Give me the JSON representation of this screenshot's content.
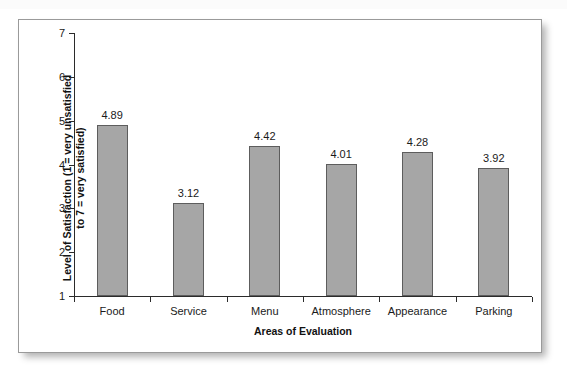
{
  "top_strip_text": "",
  "chart_data": {
    "type": "bar",
    "title": "",
    "subtitle": "",
    "xlabel": "Areas of Evaluation",
    "ylabel": "Level of Satisfaction (1 = very unsatisfied to 7 = very satisfied)",
    "ylabel_line1": "Level of Satisfaction (1 = very unsatisfied",
    "ylabel_line2": "to 7 = very satisfied)",
    "categories": [
      "Food",
      "Service",
      "Menu",
      "Atmosphere",
      "Appearance",
      "Parking"
    ],
    "values": [
      4.89,
      3.12,
      4.42,
      4.01,
      4.28,
      3.92
    ],
    "value_labels": [
      "4.89",
      "3.12",
      "4.42",
      "4.01",
      "4.28",
      "3.92"
    ],
    "ylim": [
      1,
      7
    ],
    "y_ticks": [
      1,
      2,
      3,
      4,
      5,
      6,
      7
    ],
    "y_tick_labels": [
      "1",
      "2",
      "3",
      "4",
      "5",
      "6",
      "7"
    ],
    "grid": false,
    "legend": false,
    "legend_position": "none",
    "bar_fill_color": "#a6a6a6",
    "bar_border_color": "#5d5d5d",
    "axis_color": "#2b2b2b",
    "background_color": "#ffffff"
  }
}
